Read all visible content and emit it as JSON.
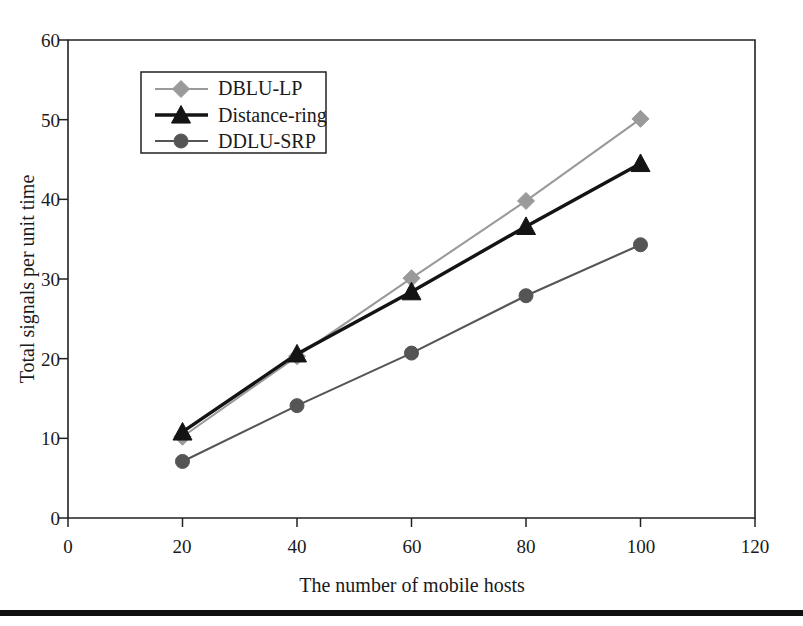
{
  "chart_data": {
    "type": "line",
    "title": "",
    "xlabel": "The number of mobile hosts",
    "ylabel": "Total signals per unit time",
    "x": [
      20,
      40,
      60,
      80,
      100
    ],
    "xlim": [
      0,
      120
    ],
    "ylim": [
      0,
      60
    ],
    "xticks": [
      "0",
      "20",
      "40",
      "60",
      "80",
      "100",
      "120"
    ],
    "yticks": [
      "0",
      "10",
      "20",
      "30",
      "40",
      "50",
      "60"
    ],
    "xtick_values": [
      0,
      20,
      40,
      60,
      80,
      100,
      120
    ],
    "ytick_values": [
      0,
      10,
      20,
      30,
      40,
      50,
      60
    ],
    "grid": false,
    "legend_position": "upper left inside",
    "series": [
      {
        "name": "DBLU-LP",
        "marker": "diamond",
        "color": "#9a9a9a",
        "values": [
          10.2,
          20.3,
          30.1,
          39.8,
          50.1
        ]
      },
      {
        "name": "Distance-ring",
        "marker": "triangle",
        "color": "#141414",
        "values": [
          10.8,
          20.6,
          28.4,
          36.6,
          44.5
        ]
      },
      {
        "name": "DDLU-SRP",
        "marker": "circle",
        "color": "#555555",
        "values": [
          7.1,
          14.1,
          20.7,
          27.9,
          34.3
        ]
      }
    ]
  },
  "axes": {
    "x_axis_title": "The number of mobile hosts",
    "y_axis_title": "Total signals per unit time"
  },
  "legend": {
    "entries": [
      {
        "label": "DBLU-LP"
      },
      {
        "label": "Distance-ring"
      },
      {
        "label": "DDLU-SRP"
      }
    ]
  },
  "xtick_labels": {
    "t0": "0",
    "t1": "20",
    "t2": "40",
    "t3": "60",
    "t4": "80",
    "t5": "100",
    "t6": "120"
  },
  "ytick_labels": {
    "t0": "0",
    "t1": "10",
    "t2": "20",
    "t3": "30",
    "t4": "40",
    "t5": "50",
    "t6": "60"
  }
}
